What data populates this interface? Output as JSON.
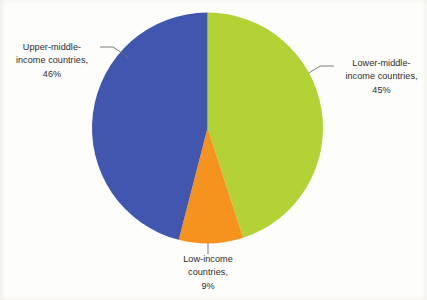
{
  "chart_data": {
    "type": "pie",
    "title": "",
    "subtitle": "",
    "xlabel": "",
    "ylabel": "",
    "legend_position": "none",
    "grid": false,
    "labels_style": "callout-with-leader-lines",
    "categories": [
      "Lower-middle-income countries",
      "Low-income countries",
      "Upper-middle-income countries"
    ],
    "values": [
      45,
      9,
      46
    ],
    "value_unit": "%",
    "colors": [
      "#b2d235",
      "#f6921e",
      "#4156ae"
    ],
    "start_angle_deg": 0,
    "direction": "clockwise",
    "slices": [
      {
        "name": "Lower-middle-income countries",
        "value": 45,
        "percent_text": "45%",
        "color": "#b2d235",
        "label_lines": [
          "Lower-middle-",
          "income countries,",
          "45%"
        ],
        "label_position": "right"
      },
      {
        "name": "Low-income countries",
        "value": 9,
        "percent_text": "9%",
        "color": "#f6921e",
        "label_lines": [
          "Low-income",
          "countries,",
          "9%"
        ],
        "label_position": "bottom"
      },
      {
        "name": "Upper-middle-income countries",
        "value": 46,
        "percent_text": "46%",
        "color": "#4156ae",
        "label_lines": [
          "Upper-middle-",
          "income countries,",
          "46%"
        ],
        "label_position": "left"
      }
    ]
  },
  "labels": {
    "upper_middle": {
      "line1": "Upper-middle-",
      "line2": "income countries,",
      "line3": "46%"
    },
    "lower_middle": {
      "line1": "Lower-middle-",
      "line2": "income countries,",
      "line3": "45%"
    },
    "low_income": {
      "line1": "Low-income",
      "line2": "countries,",
      "line3": "9%"
    }
  },
  "colors": {
    "green": "#b2d235",
    "orange": "#f6921e",
    "blue": "#4156ae",
    "text": "#2b2b2b",
    "leader_line": "#6f6f6f",
    "background": "#fdfdfb"
  }
}
